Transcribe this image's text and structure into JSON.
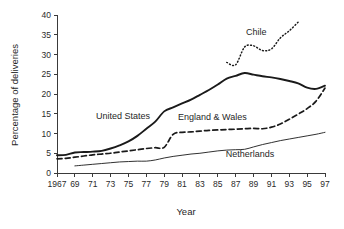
{
  "chart_data": {
    "type": "line",
    "title": "",
    "xlabel": "Year",
    "ylabel": "Percentage of deliveries",
    "xlim": [
      1967,
      1997
    ],
    "ylim": [
      0,
      40
    ],
    "grid": false,
    "legend": "inline-labels",
    "x_ticks": [
      "1967",
      "69",
      "71",
      "73",
      "75",
      "77",
      "79",
      "81",
      "83",
      "85",
      "87",
      "89",
      "91",
      "93",
      "95",
      "97"
    ],
    "x_tick_values": [
      1967,
      1969,
      1971,
      1973,
      1975,
      1977,
      1979,
      1981,
      1983,
      1985,
      1987,
      1989,
      1991,
      1993,
      1995,
      1997
    ],
    "y_ticks": [
      "0",
      "5",
      "10",
      "15",
      "20",
      "25",
      "30",
      "35",
      "40"
    ],
    "y_tick_values": [
      0,
      5,
      10,
      15,
      20,
      25,
      30,
      35,
      40
    ],
    "series": [
      {
        "name": "United States",
        "style": "solid-thick",
        "label_x": 1974.4,
        "label_y": 13.6,
        "x": [
          1967,
          1968,
          1969,
          1970,
          1971,
          1972,
          1973,
          1974,
          1975,
          1976,
          1977,
          1978,
          1979,
          1980,
          1981,
          1982,
          1983,
          1984,
          1985,
          1986,
          1987,
          1988,
          1989,
          1990,
          1991,
          1992,
          1993,
          1994,
          1995,
          1996,
          1997
        ],
        "values": [
          4.5,
          4.6,
          5.2,
          5.3,
          5.4,
          5.6,
          6.2,
          7.0,
          8.0,
          9.4,
          11.2,
          13.0,
          15.6,
          16.6,
          17.6,
          18.6,
          19.8,
          21.0,
          22.4,
          23.9,
          24.6,
          25.3,
          24.9,
          24.5,
          24.2,
          23.8,
          23.3,
          22.7,
          21.6,
          21.3,
          22.1
        ]
      },
      {
        "name": "England & Wales",
        "style": "dashed",
        "label_x": 1984.4,
        "label_y": 13.5,
        "x": [
          1967,
          1968,
          1969,
          1970,
          1971,
          1972,
          1973,
          1974,
          1975,
          1976,
          1977,
          1978,
          1979,
          1980,
          1981,
          1982,
          1983,
          1984,
          1985,
          1986,
          1987,
          1988,
          1989,
          1990,
          1991,
          1992,
          1993,
          1994,
          1995,
          1996,
          1997
        ],
        "values": [
          3.6,
          3.7,
          4.0,
          4.3,
          4.6,
          4.8,
          5.0,
          5.3,
          5.6,
          5.9,
          6.2,
          6.4,
          6.5,
          9.8,
          10.3,
          10.4,
          10.6,
          10.8,
          10.9,
          11.0,
          11.1,
          11.2,
          11.3,
          11.2,
          11.6,
          12.4,
          13.6,
          14.9,
          16.3,
          18.2,
          21.5
        ]
      },
      {
        "name": "Netherlands",
        "style": "thin",
        "label_x": 1988.6,
        "label_y": 4.1,
        "x": [
          1969,
          1970,
          1971,
          1972,
          1973,
          1974,
          1975,
          1976,
          1977,
          1978,
          1979,
          1980,
          1981,
          1982,
          1983,
          1984,
          1985,
          1986,
          1987,
          1988,
          1989,
          1990,
          1991,
          1992,
          1993,
          1994,
          1995,
          1996,
          1997
        ],
        "values": [
          1.8,
          2.0,
          2.2,
          2.4,
          2.6,
          2.8,
          2.9,
          3.0,
          3.0,
          3.3,
          3.8,
          4.2,
          4.5,
          4.8,
          5.0,
          5.3,
          5.6,
          5.8,
          5.9,
          6.0,
          6.6,
          7.2,
          7.7,
          8.2,
          8.6,
          9.0,
          9.4,
          9.8,
          10.3
        ]
      },
      {
        "name": "Chile",
        "style": "dotted",
        "label_x": 1989.3,
        "label_y": 35.0,
        "x": [
          1986,
          1987,
          1988,
          1989,
          1990,
          1991,
          1992,
          1993,
          1994
        ],
        "values": [
          28.0,
          27.4,
          31.9,
          32.2,
          31.0,
          31.4,
          34.2,
          36.0,
          38.2
        ]
      }
    ]
  }
}
